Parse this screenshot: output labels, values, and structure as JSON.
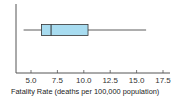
{
  "chart_data": {
    "type": "box",
    "title": "",
    "xlabel": "Fatality Rate (deaths per 100,000 population)",
    "ylabel": "",
    "orientation": "horizontal",
    "xlim": [
      3.5,
      18
    ],
    "x_ticks": [
      "5.0",
      "7.5",
      "10.0",
      "12.5",
      "15.0",
      "17.5"
    ],
    "x_tick_values": [
      5.0,
      7.5,
      10.0,
      12.5,
      15.0,
      17.5
    ],
    "grid": false,
    "series": [
      {
        "name": "Fatality Rate",
        "min": 4.3,
        "q1": 6.0,
        "median": 6.9,
        "q3": 10.4,
        "max": 15.9
      }
    ],
    "colors": {
      "box_fill": "#a8dcf0",
      "line": "#333333",
      "axis": "#555555"
    }
  }
}
